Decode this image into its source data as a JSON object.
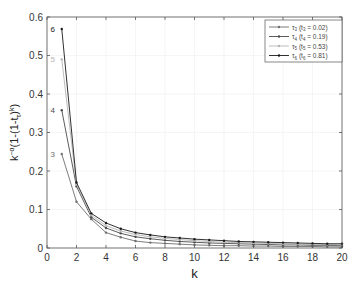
{
  "chart_data": {
    "type": "line",
    "title": "",
    "xlabel": "k",
    "ylabel": "k^{-α}(1-(1-t_τ)^k)",
    "xlim": [
      0,
      20
    ],
    "ylim": [
      0,
      0.6
    ],
    "xticks": [
      0,
      2,
      4,
      6,
      8,
      10,
      12,
      14,
      16,
      18,
      20
    ],
    "yticks": [
      0,
      0.1,
      0.2,
      0.3,
      0.4,
      0.5,
      0.6
    ],
    "xtick_labels": [
      "0",
      "2",
      "4",
      "6",
      "8",
      "10",
      "12",
      "14",
      "16",
      "18",
      "20"
    ],
    "ytick_labels": [
      "0",
      "0.1",
      "0.2",
      "0.3",
      "0.4",
      "0.5",
      "0.6"
    ],
    "grid": true,
    "legend_position": "upper right",
    "x": [
      1,
      2,
      3,
      4,
      5,
      6,
      7,
      8,
      9,
      10,
      11,
      12,
      13,
      14,
      15,
      16,
      17,
      18,
      19,
      20
    ],
    "series": [
      {
        "name": "τ3 (t3 = 0.02)",
        "sub": "3",
        "tval": "0.02",
        "label_mark": "3",
        "color": "#6e6e6e",
        "values": [
          0.244,
          0.12,
          0.075,
          0.04,
          0.028,
          0.018,
          0.014,
          0.012,
          0.01,
          0.008,
          0.007,
          0.006,
          0.006,
          0.005,
          0.005,
          0.004,
          0.004,
          0.004,
          0.003,
          0.003
        ]
      },
      {
        "name": "τ4 (t4 = 0.19)",
        "sub": "4",
        "tval": "0.19",
        "label_mark": "4",
        "color": "#4a4a4a",
        "values": [
          0.358,
          0.16,
          0.08,
          0.052,
          0.038,
          0.029,
          0.024,
          0.02,
          0.017,
          0.015,
          0.013,
          0.012,
          0.011,
          0.01,
          0.009,
          0.008,
          0.008,
          0.007,
          0.007,
          0.006
        ]
      },
      {
        "name": "τ5 (t5 = 0.53)",
        "sub": "5",
        "tval": "0.53",
        "label_mark": "5",
        "color": "#b4b4b4",
        "values": [
          0.49,
          0.165,
          0.085,
          0.058,
          0.044,
          0.035,
          0.029,
          0.025,
          0.022,
          0.019,
          0.017,
          0.015,
          0.014,
          0.013,
          0.012,
          0.011,
          0.01,
          0.009,
          0.009,
          0.008
        ]
      },
      {
        "name": "τ6 (t6 = 0.81)",
        "sub": "6",
        "tval": "0.81",
        "label_mark": "6",
        "color": "#1a1a1a",
        "values": [
          0.569,
          0.17,
          0.09,
          0.065,
          0.05,
          0.04,
          0.034,
          0.029,
          0.026,
          0.023,
          0.021,
          0.019,
          0.017,
          0.016,
          0.015,
          0.014,
          0.013,
          0.012,
          0.011,
          0.011
        ]
      }
    ]
  },
  "colors": {
    "axis": "#555555",
    "grid": "#eeeeee",
    "text": "#333333"
  }
}
